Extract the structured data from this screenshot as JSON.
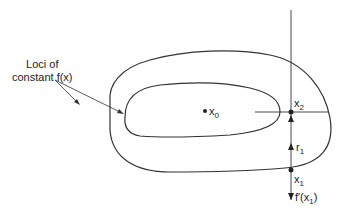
{
  "diagram": {
    "annotation": {
      "line1": "Loci of",
      "line2": "constant f(x)"
    },
    "points": {
      "x0": {
        "base": "x",
        "sub": "0"
      },
      "x1": {
        "base": "x",
        "sub": "1"
      },
      "x2": {
        "base": "x",
        "sub": "2"
      }
    },
    "vectors": {
      "r1": {
        "base": "r",
        "sub": "1"
      },
      "grad": {
        "pre": "f′(x",
        "sub": "1",
        "post": ")"
      }
    },
    "colors": {
      "stroke": "#333333",
      "text": "#222222"
    }
  }
}
